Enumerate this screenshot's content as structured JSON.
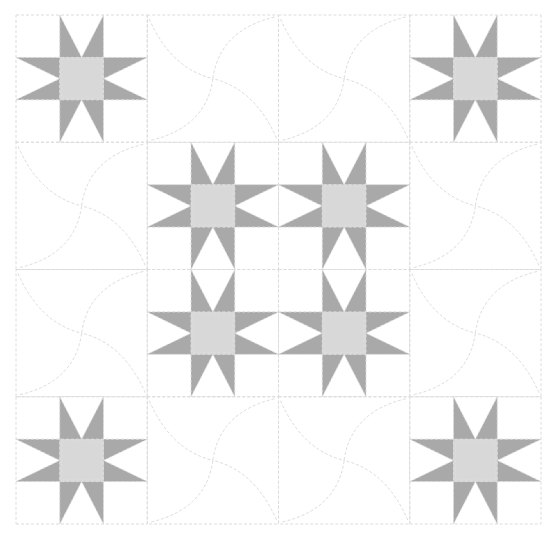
{
  "title": "Sawtooth star quilt pattern with pinwheel quilting",
  "quilt": {
    "rows": 4,
    "cols": 4,
    "origin": {
      "x": 16,
      "y": 15
    },
    "block_width": 131.25,
    "block_height": 127.25,
    "colors": {
      "background": "#ffffff",
      "star_points": "#a9a9a9",
      "star_center": "#d8d8d8",
      "stitch_line": "#dcdcdc"
    },
    "layout": [
      [
        "star",
        "quilting",
        "quilting",
        "star"
      ],
      [
        "quilting",
        "star",
        "star",
        "quilting"
      ],
      [
        "quilting",
        "star",
        "star",
        "quilting"
      ],
      [
        "star",
        "quilting",
        "quilting",
        "star"
      ]
    ],
    "block_types": {
      "star": "Sawtooth star block (3x3 units: center square + 4 flying-geese star points)",
      "quilting": "Plain block with pinwheel curved quilting lines"
    }
  }
}
